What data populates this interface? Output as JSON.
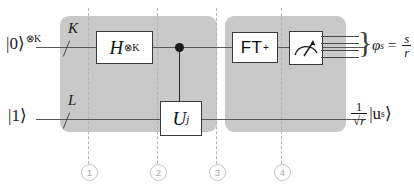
{
  "figure": {
    "background": "#ffffff",
    "panel_color": "#c9c9c9",
    "wire_color": "#5a5a5a",
    "guide_color": "#b4b4b4"
  },
  "inputs": [
    {
      "name": "top-input",
      "label": "|0⟩",
      "exponent": "⊗K",
      "wire_multiplicity": "K"
    },
    {
      "name": "bottom-input",
      "label": "|1⟩",
      "exponent": "",
      "wire_multiplicity": "L"
    }
  ],
  "gates": [
    {
      "name": "hadamard-gate",
      "base": "H",
      "exponent": "⊗K",
      "wire": "top"
    },
    {
      "name": "controlled-u-gate",
      "base": "U",
      "exponent": "j",
      "wire": "bottom"
    },
    {
      "name": "inverse-fourier-transform-gate",
      "base": "FT",
      "exponent": "+",
      "wire": "top"
    },
    {
      "name": "measurement-gate",
      "base": "",
      "exponent": "",
      "wire": "top"
    }
  ],
  "control": {
    "name": "control-dot",
    "from_wire": "top",
    "to_gate": "controlled-u-gate"
  },
  "classical_outputs": {
    "count": 4,
    "brace": "}"
  },
  "outputs": {
    "phase": {
      "symbol": "φ",
      "subscript": "s",
      "equals": "=",
      "numerator": "s",
      "denominator": "r"
    },
    "state": {
      "numerator": "1",
      "denominator_radical": "r",
      "radical_sign": "√",
      "ket": "|u",
      "ket_subscript": "s",
      "ket_close": "⟩"
    }
  },
  "time_markers": [
    {
      "name": "time-marker-1",
      "label": "1"
    },
    {
      "name": "time-marker-2",
      "label": "2"
    },
    {
      "name": "time-marker-3",
      "label": "3"
    },
    {
      "name": "time-marker-4",
      "label": "4"
    }
  ]
}
